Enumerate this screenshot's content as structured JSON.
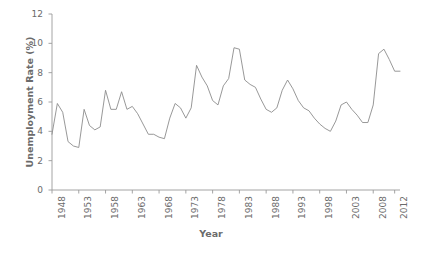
{
  "chart_data": {
    "type": "line",
    "title": "",
    "xlabel": "Year",
    "ylabel": "Unemployment Rate (%)",
    "xlim": [
      1948,
      2013
    ],
    "ylim": [
      0,
      12
    ],
    "grid": false,
    "legend": false,
    "line_color": "#8c8c8c",
    "axis_color": "#9a9a9a",
    "text_color": "#6b6b6b",
    "xticks": [
      1948,
      1953,
      1958,
      1963,
      1968,
      1973,
      1978,
      1983,
      1988,
      1993,
      1998,
      2003,
      2008,
      2012
    ],
    "xticklabels": [
      "1948",
      "1953",
      "1958",
      "1963",
      "1968",
      "1973",
      "1978",
      "1983",
      "1988",
      "1993",
      "1998",
      "2003",
      "2008",
      "2012"
    ],
    "yticks": [
      0,
      2,
      4,
      6,
      8,
      10,
      12
    ],
    "yticklabels": [
      "0",
      "2",
      "4",
      "6",
      "8",
      "10",
      "12"
    ],
    "x": [
      1948,
      1949,
      1950,
      1951,
      1952,
      1953,
      1954,
      1955,
      1956,
      1957,
      1958,
      1959,
      1960,
      1961,
      1962,
      1963,
      1964,
      1965,
      1966,
      1967,
      1968,
      1969,
      1970,
      1971,
      1972,
      1973,
      1974,
      1975,
      1976,
      1977,
      1978,
      1979,
      1980,
      1981,
      1982,
      1983,
      1984,
      1985,
      1986,
      1987,
      1988,
      1989,
      1990,
      1991,
      1992,
      1993,
      1994,
      1995,
      1996,
      1997,
      1998,
      1999,
      2000,
      2001,
      2002,
      2003,
      2004,
      2005,
      2006,
      2007,
      2008,
      2009,
      2010,
      2011,
      2012,
      2013
    ],
    "values": [
      3.8,
      5.9,
      5.3,
      3.3,
      3.0,
      2.9,
      5.5,
      4.4,
      4.1,
      4.3,
      6.8,
      5.5,
      5.5,
      6.7,
      5.5,
      5.7,
      5.2,
      4.5,
      3.8,
      3.8,
      3.6,
      3.5,
      4.9,
      5.9,
      5.6,
      4.9,
      5.6,
      8.5,
      7.7,
      7.1,
      6.1,
      5.8,
      7.1,
      7.6,
      9.7,
      9.6,
      7.5,
      7.2,
      7.0,
      6.2,
      5.5,
      5.3,
      5.6,
      6.8,
      7.5,
      6.9,
      6.1,
      5.6,
      5.4,
      4.9,
      4.5,
      4.2,
      4.0,
      4.7,
      5.8,
      6.0,
      5.5,
      5.1,
      4.6,
      4.6,
      5.8,
      9.3,
      9.6,
      8.9,
      8.1,
      8.1
    ],
    "series_name": "Unemployment Rate"
  },
  "axes": {
    "ylabel_text": "Unemployment Rate (%)",
    "xlabel_text": "Year"
  }
}
